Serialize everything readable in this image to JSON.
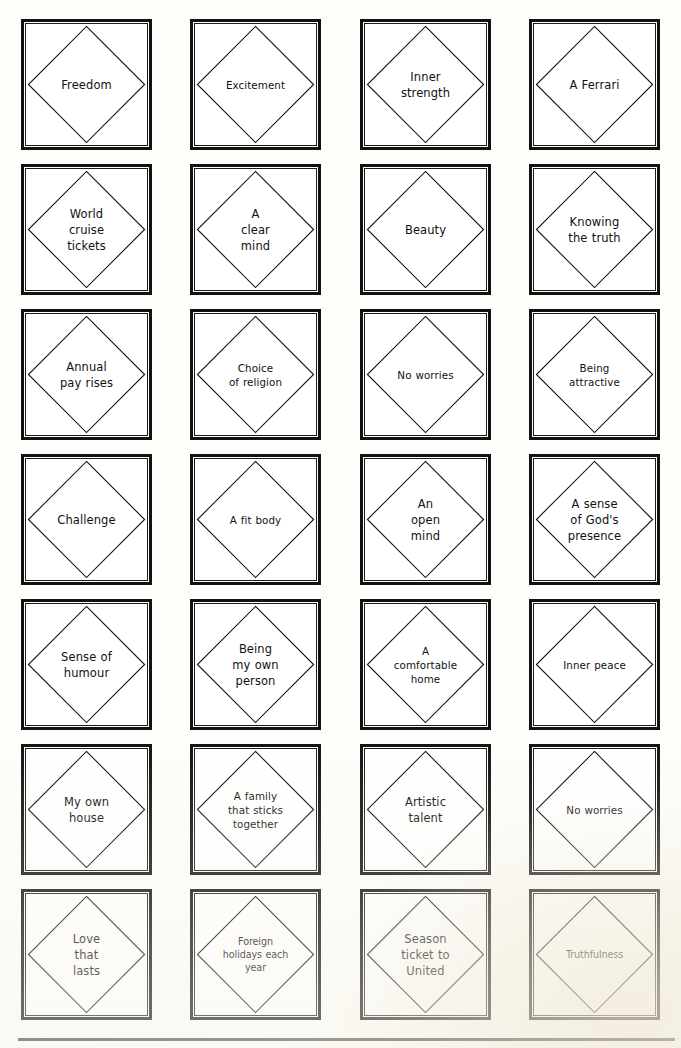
{
  "sheet": {
    "title": "Diamond ranking value cards",
    "columns": 4,
    "rows": 7,
    "card_shape": "diamond-in-square",
    "ink_color": "#121212",
    "card_background": "#ffffff",
    "page_background": "#fdfdfa"
  },
  "cards": [
    {
      "id": "r1c1",
      "row": 1,
      "col": 1,
      "lines": [
        "Freedom"
      ],
      "text": "Freedom"
    },
    {
      "id": "r1c2",
      "row": 1,
      "col": 2,
      "lines": [
        "Excitement"
      ],
      "text": "Excitement"
    },
    {
      "id": "r1c3",
      "row": 1,
      "col": 3,
      "lines": [
        "Inner",
        "strength"
      ],
      "text": "Inner\nstrength"
    },
    {
      "id": "r1c4",
      "row": 1,
      "col": 4,
      "lines": [
        "A Ferrari"
      ],
      "text": "A Ferrari"
    },
    {
      "id": "r2c1",
      "row": 2,
      "col": 1,
      "lines": [
        "World",
        "cruise",
        "tickets"
      ],
      "text": "World\ncruise\ntickets"
    },
    {
      "id": "r2c2",
      "row": 2,
      "col": 2,
      "lines": [
        "A",
        "clear",
        "mind"
      ],
      "text": "A\nclear\nmind"
    },
    {
      "id": "r2c3",
      "row": 2,
      "col": 3,
      "lines": [
        "Beauty"
      ],
      "text": "Beauty"
    },
    {
      "id": "r2c4",
      "row": 2,
      "col": 4,
      "lines": [
        "Knowing",
        "the truth"
      ],
      "text": "Knowing\nthe truth"
    },
    {
      "id": "r3c1",
      "row": 3,
      "col": 1,
      "lines": [
        "Annual",
        "pay rises"
      ],
      "text": "Annual\npay rises"
    },
    {
      "id": "r3c2",
      "row": 3,
      "col": 2,
      "lines": [
        "Choice",
        "of religion"
      ],
      "text": "Choice\nof religion"
    },
    {
      "id": "r3c3",
      "row": 3,
      "col": 3,
      "lines": [
        "No worries"
      ],
      "text": "No worries"
    },
    {
      "id": "r3c4",
      "row": 3,
      "col": 4,
      "lines": [
        "Being",
        "attractive"
      ],
      "text": "Being\nattractive"
    },
    {
      "id": "r4c1",
      "row": 4,
      "col": 1,
      "lines": [
        "Challenge"
      ],
      "text": "Challenge"
    },
    {
      "id": "r4c2",
      "row": 4,
      "col": 2,
      "lines": [
        "A fit body"
      ],
      "text": "A fit body"
    },
    {
      "id": "r4c3",
      "row": 4,
      "col": 3,
      "lines": [
        "An",
        "open",
        "mind"
      ],
      "text": "An\nopen\nmind"
    },
    {
      "id": "r4c4",
      "row": 4,
      "col": 4,
      "lines": [
        "A sense",
        "of God's",
        "presence"
      ],
      "text": "A sense\nof God's\npresence"
    },
    {
      "id": "r5c1",
      "row": 5,
      "col": 1,
      "lines": [
        "Sense of",
        "humour"
      ],
      "text": "Sense of\nhumour"
    },
    {
      "id": "r5c2",
      "row": 5,
      "col": 2,
      "lines": [
        "Being",
        "my own",
        "person"
      ],
      "text": "Being\nmy own\nperson"
    },
    {
      "id": "r5c3",
      "row": 5,
      "col": 3,
      "lines": [
        "A",
        "comfortable",
        "home"
      ],
      "text": "A\ncomfortable\nhome"
    },
    {
      "id": "r5c4",
      "row": 5,
      "col": 4,
      "lines": [
        "Inner peace"
      ],
      "text": "Inner peace"
    },
    {
      "id": "r6c1",
      "row": 6,
      "col": 1,
      "lines": [
        "My own",
        "house"
      ],
      "text": "My own\nhouse"
    },
    {
      "id": "r6c2",
      "row": 6,
      "col": 2,
      "lines": [
        "A family",
        "that sticks",
        "together"
      ],
      "text": "A family\nthat sticks\ntogether"
    },
    {
      "id": "r6c3",
      "row": 6,
      "col": 3,
      "lines": [
        "Artistic",
        "talent"
      ],
      "text": "Artistic\ntalent"
    },
    {
      "id": "r6c4",
      "row": 6,
      "col": 4,
      "lines": [
        "No worries"
      ],
      "text": "No worries"
    },
    {
      "id": "r7c1",
      "row": 7,
      "col": 1,
      "lines": [
        "Love",
        "that",
        "lasts"
      ],
      "text": "Love\nthat\nlasts"
    },
    {
      "id": "r7c2",
      "row": 7,
      "col": 2,
      "lines": [
        "Foreign",
        "holidays each",
        "year"
      ],
      "text": "Foreign\nholidays each\nyear"
    },
    {
      "id": "r7c3",
      "row": 7,
      "col": 3,
      "lines": [
        "Season",
        "ticket to",
        "United"
      ],
      "text": "Season\nticket to\nUnited"
    },
    {
      "id": "r7c4",
      "row": 7,
      "col": 4,
      "lines": [
        "Truthfulness"
      ],
      "text": "Truthfulness"
    }
  ]
}
